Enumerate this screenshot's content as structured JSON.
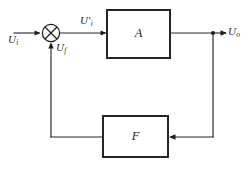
{
  "diagram": {
    "canvas": {
      "width": 250,
      "height": 174,
      "background": "#ffffff"
    },
    "stroke_color": "#1c1c1c",
    "wire_color": "#2b2b2b",
    "blocks": [
      {
        "id": "amplifier",
        "label": "A",
        "role": "basic amplifier",
        "x": 107,
        "y": 10,
        "width": 63,
        "height": 48
      },
      {
        "id": "feedback",
        "label": "F",
        "role": "feedback network",
        "x": 103,
        "y": 116,
        "width": 65,
        "height": 41
      }
    ],
    "summing_junction": {
      "id": "summer",
      "symbol": "circle-with-cross",
      "cx": 51,
      "cy": 33,
      "r": 9
    },
    "node_dot": {
      "id": "output-tap",
      "cx": 213,
      "cy": 33,
      "r": 2.1
    },
    "signals": [
      {
        "id": "input",
        "base": "U",
        "sub": "i",
        "prime": false,
        "text": "Ui",
        "x": 8,
        "y": 34
      },
      {
        "id": "error",
        "base": "U",
        "sub": "i",
        "prime": true,
        "text": "U'i",
        "x": 80,
        "y": 15
      },
      {
        "id": "feedback",
        "base": "U",
        "sub": "f",
        "prime": false,
        "text": "Uf",
        "x": 56,
        "y": 42
      },
      {
        "id": "output",
        "base": "U",
        "sub": "o",
        "prime": false,
        "text": "Uo",
        "x": 228,
        "y": 26
      }
    ],
    "wires": [
      {
        "id": "input-wire",
        "from": "input-source",
        "to": "summer",
        "arrow": true
      },
      {
        "id": "error-wire",
        "from": "summer",
        "to": "amplifier",
        "arrow": true
      },
      {
        "id": "amplifier-output-wire",
        "from": "amplifier",
        "to": "output-tap",
        "arrow": false
      },
      {
        "id": "output-wire",
        "from": "output-tap",
        "to": "output-load",
        "arrow": true
      },
      {
        "id": "tap-down-wire",
        "from": "output-tap",
        "to": "feedback",
        "arrow": true
      },
      {
        "id": "feedback-return-wire",
        "from": "feedback",
        "to": "summer",
        "arrow": true
      }
    ]
  }
}
